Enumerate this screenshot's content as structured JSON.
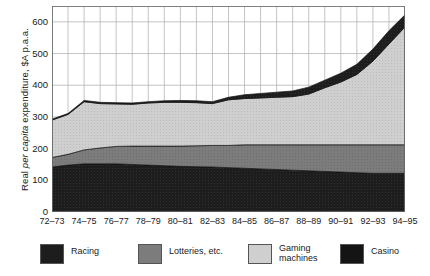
{
  "chart_data": {
    "type": "area",
    "title": "",
    "subtitle": "",
    "xlabel": "",
    "ylabel": "Real per capita expenditure, $A p.a.a.",
    "ylabel_italic_part": "per capita",
    "ylim": [
      0,
      650
    ],
    "yticks": [
      0,
      100,
      200,
      300,
      400,
      500,
      600
    ],
    "yticklabels": [
      "0",
      "100",
      "200",
      "300",
      "400",
      "500",
      "600"
    ],
    "y_minor_ticks": [
      50,
      150,
      250,
      350,
      450,
      550,
      650
    ],
    "grid": true,
    "grid_color": "#b5b5b5",
    "legend_position": "bottom",
    "stacked": true,
    "stack_order_bottom_to_top": [
      "Racing",
      "Lotteries, etc.",
      "Gaming machines",
      "Casino"
    ],
    "categories": [
      "72–73",
      "73–74",
      "74–75",
      "75–76",
      "76–77",
      "77–78",
      "78–79",
      "79–80",
      "80–81",
      "81–82",
      "82–83",
      "83–84",
      "84–85",
      "85–86",
      "86–87",
      "87–88",
      "88–89",
      "89–90",
      "90–91",
      "91–92",
      "92–93",
      "93–94",
      "94–95"
    ],
    "xticklabels": [
      "72–73",
      "",
      "74–75",
      "",
      "76–77",
      "",
      "78–79",
      "",
      "80–81",
      "",
      "82–83",
      "",
      "84–85",
      "",
      "86–87",
      "",
      "88–89",
      "",
      "90–91",
      "",
      "92–93",
      "",
      "94–95"
    ],
    "series": [
      {
        "name": "Racing",
        "color": "#1c1c1c",
        "values": [
          142,
          148,
          152,
          152,
          152,
          150,
          148,
          146,
          144,
          143,
          142,
          140,
          138,
          136,
          134,
          132,
          130,
          128,
          126,
          124,
          122,
          122,
          122
        ]
      },
      {
        "name": "Lotteries, etc.",
        "color": "#7a7a7a",
        "values": [
          30,
          34,
          44,
          50,
          55,
          58,
          60,
          62,
          64,
          66,
          68,
          70,
          74,
          76,
          78,
          80,
          82,
          84,
          86,
          88,
          90,
          90,
          90
        ]
      },
      {
        "name": "Gaming machines",
        "color": "#c9c9c9",
        "values": [
          118,
          126,
          152,
          140,
          134,
          132,
          136,
          138,
          138,
          136,
          132,
          144,
          146,
          148,
          150,
          152,
          160,
          180,
          198,
          222,
          264,
          318,
          372
        ]
      },
      {
        "name": "Casino",
        "color": "#1c1c1c",
        "values": [
          3,
          3,
          4,
          4,
          4,
          4,
          4,
          5,
          6,
          6,
          6,
          8,
          12,
          14,
          16,
          18,
          22,
          24,
          28,
          32,
          38,
          42,
          38
        ]
      }
    ],
    "totals": [
      293,
      311,
      352,
      346,
      345,
      344,
      348,
      351,
      352,
      351,
      348,
      362,
      370,
      374,
      378,
      382,
      394,
      416,
      438,
      466,
      514,
      572,
      622
    ]
  },
  "legend": {
    "items": [
      {
        "label": "Racing",
        "color": "#1c1c1c",
        "x": 40
      },
      {
        "label": "Lotteries, etc.",
        "color": "#7a7a7a",
        "x": 138
      },
      {
        "label": "Gaming\nmachines",
        "color": "#c9c9c9",
        "x": 248
      },
      {
        "label": "Casino",
        "color": "#1c1c1c",
        "x": 340
      }
    ]
  }
}
